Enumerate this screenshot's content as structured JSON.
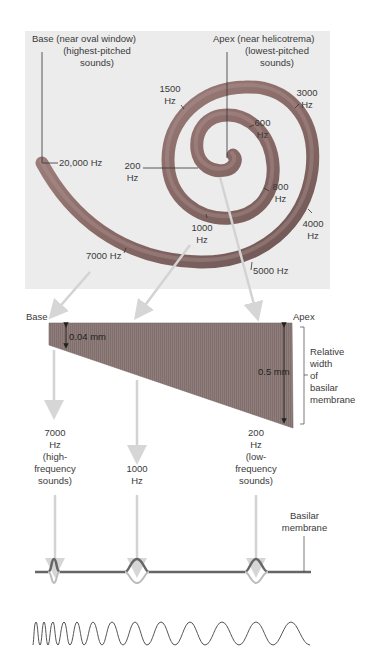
{
  "header": {
    "text": ""
  },
  "cochlea_panel": {
    "base_label": "Base",
    "base_desc_1": "(near oval window)",
    "base_desc_2": "(highest-pitched",
    "base_desc_3": "sounds)",
    "apex_label": "Apex",
    "apex_desc_1": "(near helicotrema)",
    "apex_desc_2": "(lowest-pitched",
    "apex_desc_3": "sounds)",
    "frequencies": [
      {
        "value": "20,000 Hz"
      },
      {
        "value": "1500",
        "unit": "Hz"
      },
      {
        "value": "3000",
        "unit": "Hz"
      },
      {
        "value": "600",
        "unit": "Hz"
      },
      {
        "value": "200",
        "unit": "Hz"
      },
      {
        "value": "800",
        "unit": "Hz"
      },
      {
        "value": "4000",
        "unit": "Hz"
      },
      {
        "value": "1000",
        "unit": "Hz"
      },
      {
        "value": "7000 Hz"
      },
      {
        "value": "5000 Hz"
      }
    ]
  },
  "membrane": {
    "base_label": "Base",
    "apex_label": "Apex",
    "base_width": "0.04 mm",
    "apex_width": "0.5 mm",
    "side_label_1": "Relative",
    "side_label_2": "width",
    "side_label_3": "of",
    "side_label_4": "basilar",
    "side_label_5": "membrane"
  },
  "response_labels": [
    {
      "l1": "7000",
      "l2": "Hz",
      "l3": "(high-",
      "l4": "frequency",
      "l5": "sounds)"
    },
    {
      "l1": "1000",
      "l2": "Hz"
    },
    {
      "l1": "200",
      "l2": "Hz",
      "l3": "(low-",
      "l4": "frequency",
      "l5": "sounds)"
    }
  ],
  "basilar_label_1": "Basilar",
  "basilar_label_2": "membrane",
  "colors": {
    "panel_bg": "#ececec",
    "spiral": "#8e6f6c",
    "membrane": "#8c7a78",
    "arrow": "#d6d6d6",
    "wave": "#555555"
  }
}
